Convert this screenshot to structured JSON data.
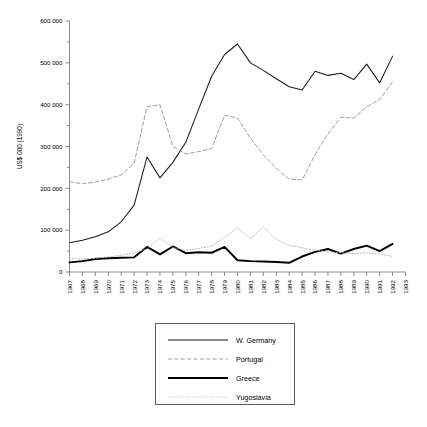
{
  "chart_data": {
    "type": "line",
    "title": "",
    "xlabel": "",
    "ylabel": "US$ 000 (1990)",
    "grid": false,
    "legend_position": "below-center",
    "xlim": [
      1967,
      1993
    ],
    "ylim": [
      0,
      600000
    ],
    "ytick_labels": [
      "600 000",
      "500 000",
      "400 000",
      "300 000",
      "200 000",
      "100 000",
      "0"
    ],
    "ytick_values": [
      600000,
      500000,
      400000,
      300000,
      200000,
      100000,
      0
    ],
    "xtick_labels": [
      "1967",
      "1968",
      "1969",
      "1970",
      "1971",
      "1972",
      "1973",
      "1974",
      "1975",
      "1976",
      "1977",
      "1978",
      "1979",
      "1980",
      "1981",
      "1982",
      "1983",
      "1984",
      "1985",
      "1986",
      "1987",
      "1988",
      "1989",
      "1990",
      "1991",
      "1992",
      "1993"
    ],
    "x": [
      1967,
      1968,
      1969,
      1970,
      1971,
      1972,
      1973,
      1974,
      1975,
      1976,
      1977,
      1978,
      1979,
      1980,
      1981,
      1982,
      1983,
      1984,
      1985,
      1986,
      1987,
      1988,
      1989,
      1990,
      1991,
      1992
    ],
    "series": [
      {
        "name": "W. Germany",
        "style": "solid-thin",
        "color": "#1a1a1a",
        "values": [
          70000,
          76000,
          84000,
          96000,
          120000,
          160000,
          275000,
          225000,
          262000,
          310000,
          390000,
          468000,
          520000,
          545000,
          500000,
          482000,
          462000,
          443000,
          435000,
          480000,
          470000,
          475000,
          460000,
          497000,
          452000,
          516000
        ]
      },
      {
        "name": "Portugal",
        "style": "dashed",
        "color": "#9a9a9a",
        "values": [
          216000,
          211000,
          215000,
          222000,
          232000,
          260000,
          395000,
          400000,
          300000,
          282000,
          288000,
          295000,
          375000,
          368000,
          320000,
          280000,
          248000,
          222000,
          220000,
          280000,
          330000,
          370000,
          368000,
          395000,
          412000,
          455000
        ]
      },
      {
        "name": "Greece",
        "style": "solid-thick",
        "color": "#000000",
        "values": [
          23000,
          26000,
          31000,
          33000,
          34000,
          35000,
          60000,
          42000,
          61000,
          45000,
          47000,
          46000,
          60000,
          28000,
          26000,
          25000,
          24000,
          22000,
          37000,
          48000,
          55000,
          44000,
          55000,
          63000,
          50000,
          67000
        ]
      },
      {
        "name": "Yugoslavia",
        "style": "dotted",
        "color": "#b0b0b0",
        "values": [
          33000,
          31000,
          33000,
          36000,
          40000,
          46000,
          55000,
          82000,
          58000,
          52000,
          56000,
          62000,
          82000,
          105000,
          80000,
          108000,
          78000,
          64000,
          58000,
          52000,
          48000,
          46000,
          44000,
          46000,
          43000,
          37000
        ]
      }
    ]
  },
  "legend": {
    "items": [
      {
        "label": "W. Germany",
        "style": "solid-thin"
      },
      {
        "label": "Portugal",
        "style": "dashed"
      },
      {
        "label": "Greece",
        "style": "solid-thick"
      },
      {
        "label": "Yugoslavia",
        "style": "dotted"
      }
    ]
  }
}
